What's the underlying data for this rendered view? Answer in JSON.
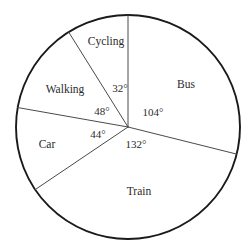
{
  "chart_data": {
    "type": "pie",
    "title": "",
    "subtitle": "",
    "xlabel": "",
    "ylabel": "",
    "legend_position": "none",
    "grid": false,
    "total_degrees": 360,
    "categories": [
      "Cycling",
      "Walking",
      "Car",
      "Train",
      "Bus"
    ],
    "values": [
      32,
      48,
      44,
      132,
      104
    ],
    "value_unit": "degrees",
    "data_labels": [
      "32°",
      "48°",
      "44°",
      "132°",
      "104°"
    ],
    "slices": [
      {
        "label": "Cycling",
        "degrees": 32,
        "degrees_label": "32°",
        "percent": 8.89
      },
      {
        "label": "Walking",
        "degrees": 48,
        "degrees_label": "48°",
        "percent": 13.33
      },
      {
        "label": "Car",
        "degrees": 44,
        "degrees_label": "44°",
        "percent": 12.22
      },
      {
        "label": "Train",
        "degrees": 132,
        "degrees_label": "132°",
        "percent": 36.67
      },
      {
        "label": "Bus",
        "degrees": 104,
        "degrees_label": "104°",
        "percent": 28.89
      }
    ],
    "colors": {
      "outline": "#1a1a1a",
      "radius_line": "#4a4a4a",
      "slice_fill": "#ffffff",
      "text": "#2b2b2b",
      "background": "#ffffff"
    }
  },
  "figure": {
    "center_x": 128,
    "center_y": 127,
    "radius": 112,
    "start_angle_deg": 90,
    "direction": "counterclockwise"
  },
  "labels": {
    "cycling": "Cycling",
    "walking": "Walking",
    "car": "Car",
    "train": "Train",
    "bus": "Bus"
  },
  "angle_labels": {
    "cycling": "32°",
    "walking": "48°",
    "car": "44°",
    "train": "132°",
    "bus": "104°"
  },
  "label_positions": {
    "cycling": {
      "x": 106,
      "y": 42
    },
    "walking": {
      "x": 65,
      "y": 90
    },
    "car": {
      "x": 47,
      "y": 145
    },
    "train": {
      "x": 139,
      "y": 192
    },
    "bus": {
      "x": 186,
      "y": 85
    }
  },
  "angle_label_positions": {
    "cycling": {
      "x": 120,
      "y": 89
    },
    "walking": {
      "x": 102,
      "y": 112
    },
    "car": {
      "x": 98,
      "y": 135
    },
    "train": {
      "x": 136,
      "y": 145
    },
    "bus": {
      "x": 153,
      "y": 113
    }
  }
}
